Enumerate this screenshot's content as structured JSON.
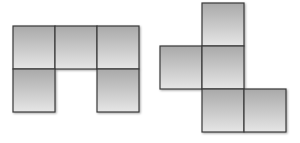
{
  "diagram": {
    "colors": {
      "fill_top": "#a9a9a9",
      "fill_bottom": "#e6e6e6",
      "stroke": "#3a3a3a",
      "background": "#ffffff"
    },
    "figures": [
      {
        "name": "left-figure",
        "shape": "U-shaped pentomino (upside-down U)",
        "cell_count": 5,
        "cells_grid": [
          [
            0,
            0
          ],
          [
            1,
            0
          ],
          [
            2,
            0
          ],
          [
            0,
            1
          ],
          [
            2,
            1
          ]
        ]
      },
      {
        "name": "right-figure",
        "shape": "F-like pentomino / cube net fragment",
        "cell_count": 5,
        "cells_grid": [
          [
            1,
            0
          ],
          [
            0,
            1
          ],
          [
            1,
            1
          ],
          [
            1,
            2
          ],
          [
            2,
            2
          ]
        ]
      }
    ]
  }
}
